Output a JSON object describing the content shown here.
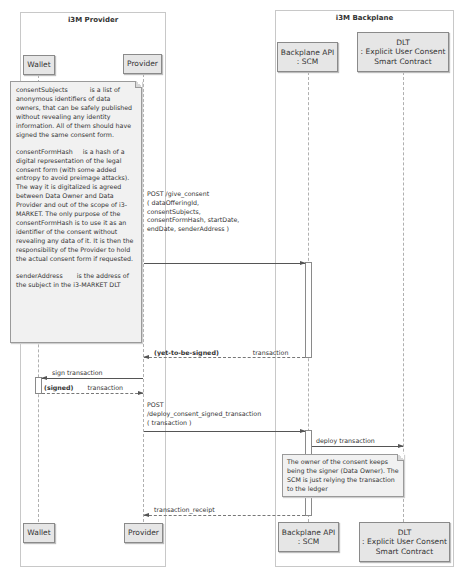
{
  "frames": {
    "provider": {
      "title": "i3M Provider"
    },
    "backplane": {
      "title": "i3M Backplane"
    }
  },
  "participants": {
    "wallet": {
      "label": "Wallet"
    },
    "provider": {
      "label": "Provider"
    },
    "scm": {
      "line1": "Backplane API",
      "line2": ": SCM"
    },
    "dlt": {
      "line1": "DLT",
      "line2": ": Explicit User Consent",
      "line3": "Smart Contract"
    }
  },
  "notes": {
    "consent_details": {
      "p1_term": "consentSubjects",
      "p1_text": "is a list of anonymous identifiers of data owners, that can be safely published without revealing any identity information. All of them should have signed the same consent form.",
      "p2_term": "consentFormHash",
      "p2_text": "is a hash of a digital representation of the legal consent form (with some added entropy to avoid preimage attacks). The way it is digitalized is agreed between Data Owner and Data Provider and out of the scope of i3-MARKET. The only purpose of the consentFormHash is to use it as an identifier of the consent without revealing any data of it. It is then the responsibility of the Provider to hold the actual consent form if requested.",
      "p3_term": "senderAddress",
      "p3_text": "is the address of the subject in the i3-MARKET DLT"
    },
    "signer_note": {
      "text": "The owner of the consent keeps being the signer (Data Owner). The SCM is just relying the transaction to the ledger"
    }
  },
  "messages": {
    "give_consent": {
      "line1": "POST /give_consent",
      "line2": "( dataOfferingId,",
      "line3": "consentSubjects,",
      "line4": "consentFormHash, startDate,",
      "line5": "endDate, senderAddress )"
    },
    "yet_to_be_signed": {
      "tag": "(yet-to-be-signed)",
      "label": "transaction"
    },
    "sign_transaction": {
      "label": "sign transaction"
    },
    "signed": {
      "tag": "(signed)",
      "label": "transaction"
    },
    "deploy_signed": {
      "line1": "POST",
      "line2": "/deploy_consent_signed_transaction",
      "line3": "( transaction )"
    },
    "deploy_transaction": {
      "label": "deploy transaction"
    },
    "transaction_receipt": {
      "label": "transaction_receipt"
    }
  }
}
